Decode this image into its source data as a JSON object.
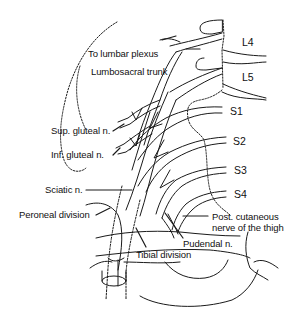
{
  "diagram": {
    "labels": {
      "to_lumbar_plexus": "To lumbar plexus",
      "lumbosacral_trunk": "Lumbosacral trunk",
      "sup_gluteal": "Sup. gluteal n.",
      "inf_gluteal": "Inf. gluteal n.",
      "sciatic": "Sciatic n.",
      "peroneal_division": "Peroneal division",
      "tibial_division": "Tibial division",
      "pudendal": "Pudendal n.",
      "post_cutaneous_line1": "Post. cutaneous",
      "post_cutaneous_line2": "nerve of the thigh"
    },
    "root_labels": {
      "L4": "L4",
      "L5": "L5",
      "S1": "S1",
      "S2": "S2",
      "S3": "S3",
      "S4": "S4"
    },
    "line_color": "#1a1a1a",
    "background": "#ffffff"
  }
}
